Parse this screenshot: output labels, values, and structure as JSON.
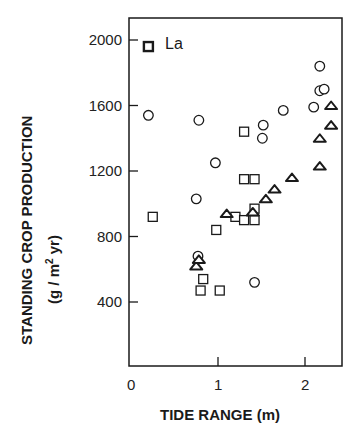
{
  "chart_data": {
    "type": "scatter",
    "title": "",
    "xlabel": "TIDE RANGE  (m)",
    "ylabel": "STANDING CROP PRODUCTION",
    "ylabel_units": "(g / m² yr)",
    "xlim": [
      0,
      2.45
    ],
    "ylim": [
      150,
      2120
    ],
    "xticks": [
      0,
      1,
      2
    ],
    "yticks": [
      400,
      800,
      1200,
      1600,
      2000
    ],
    "grid": false,
    "legend": {
      "position": "top-left",
      "entries": [
        {
          "marker": "square-filled-bold",
          "label": "La"
        }
      ]
    },
    "series": [
      {
        "name": "circles",
        "marker": "circle",
        "points": [
          [
            0.2,
            1540
          ],
          [
            0.78,
            1510
          ],
          [
            0.75,
            1030
          ],
          [
            0.97,
            1250
          ],
          [
            1.52,
            1480
          ],
          [
            1.51,
            1400
          ],
          [
            1.75,
            1570
          ],
          [
            2.1,
            1590
          ],
          [
            2.17,
            1690
          ],
          [
            2.22,
            1700
          ],
          [
            0.77,
            680
          ],
          [
            2.17,
            1840
          ],
          [
            1.42,
            520
          ]
        ]
      },
      {
        "name": "squares",
        "marker": "square",
        "points": [
          [
            0.2,
            1960
          ],
          [
            0.25,
            920
          ],
          [
            1.3,
            1440
          ],
          [
            1.3,
            1150
          ],
          [
            1.42,
            1150
          ],
          [
            0.98,
            840
          ],
          [
            1.2,
            920
          ],
          [
            1.3,
            900
          ],
          [
            1.42,
            900
          ],
          [
            1.42,
            970
          ],
          [
            0.83,
            540
          ],
          [
            0.8,
            470
          ],
          [
            1.02,
            470
          ]
        ]
      },
      {
        "name": "triangles",
        "marker": "triangle",
        "points": [
          [
            0.75,
            620
          ],
          [
            0.78,
            660
          ],
          [
            1.1,
            940
          ],
          [
            1.4,
            950
          ],
          [
            1.55,
            1030
          ],
          [
            1.65,
            1090
          ],
          [
            1.85,
            1160
          ],
          [
            2.17,
            1230
          ],
          [
            2.17,
            1400
          ],
          [
            2.3,
            1480
          ],
          [
            2.3,
            1600
          ]
        ]
      }
    ],
    "annotations": [
      {
        "text": "La",
        "near": [
          0.2,
          1960
        ]
      }
    ]
  },
  "axes": {
    "x_tick_labels": [
      "0",
      "1",
      "2"
    ],
    "y_tick_labels": [
      "400",
      "800",
      "1200",
      "1600",
      "2000"
    ],
    "x_title": "TIDE RANGE  (m)",
    "y_title": "STANDING CROP PRODUCTION",
    "y_units_prefix": "(g / m",
    "y_units_sup": "2",
    "y_units_suffix": " yr)"
  },
  "legend": {
    "label": "La"
  },
  "colors": {
    "ink": "#1a1a1a",
    "background": "#ffffff"
  }
}
